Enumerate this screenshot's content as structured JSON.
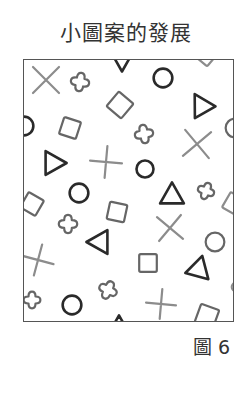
{
  "title": "小圖案的發展",
  "caption": {
    "label": "圖",
    "number": "6"
  },
  "colors": {
    "dark": "#2a2a2a",
    "mid": "#666666",
    "light": "#8c8c8c",
    "frame": "#555555"
  },
  "shapes": [
    {
      "type": "cross-x",
      "x": 22,
      "y": 20,
      "s": 13,
      "c": "light",
      "r": 0
    },
    {
      "type": "clover",
      "x": 56,
      "y": 22,
      "s": 11,
      "c": "mid",
      "r": 10
    },
    {
      "type": "triangle",
      "x": 98,
      "y": -2,
      "s": 15,
      "c": "dark",
      "r": 180
    },
    {
      "type": "circle",
      "x": 139,
      "y": 18,
      "s": 11,
      "c": "dark",
      "r": 0
    },
    {
      "type": "square",
      "x": 182,
      "y": -6,
      "s": 11,
      "c": "light",
      "r": 40
    },
    {
      "type": "square",
      "x": 96,
      "y": 45,
      "s": 12,
      "c": "mid",
      "r": 40
    },
    {
      "type": "triangle",
      "x": 177,
      "y": 45,
      "s": 14,
      "c": "dark",
      "r": -30
    },
    {
      "type": "circle",
      "x": 0,
      "y": 66,
      "s": 11,
      "c": "dark",
      "r": 0
    },
    {
      "type": "square",
      "x": 46,
      "y": 68,
      "s": 11,
      "c": "mid",
      "r": 18
    },
    {
      "type": "clover",
      "x": 120,
      "y": 74,
      "s": 11,
      "c": "mid",
      "r": -10
    },
    {
      "type": "cross-x",
      "x": 173,
      "y": 84,
      "s": 13,
      "c": "light",
      "r": 5
    },
    {
      "type": "circle",
      "x": 211,
      "y": 68,
      "s": 11,
      "c": "mid",
      "r": 0
    },
    {
      "type": "triangle",
      "x": 30,
      "y": 103,
      "s": 14,
      "c": "dark",
      "r": 90
    },
    {
      "type": "plus",
      "x": 82,
      "y": 102,
      "s": 16,
      "c": "light",
      "r": 5
    },
    {
      "type": "circle",
      "x": 121,
      "y": 109,
      "s": 10,
      "c": "dark",
      "r": 0
    },
    {
      "type": "circle",
      "x": 55,
      "y": 133,
      "s": 11,
      "c": "dark",
      "r": 0
    },
    {
      "type": "triangle",
      "x": 148,
      "y": 135,
      "s": 14,
      "c": "dark",
      "r": 0
    },
    {
      "type": "clover",
      "x": 182,
      "y": 131,
      "s": 10,
      "c": "mid",
      "r": 20
    },
    {
      "type": "square",
      "x": 8,
      "y": 144,
      "s": 11,
      "c": "mid",
      "r": 30
    },
    {
      "type": "square",
      "x": 93,
      "y": 152,
      "s": 11,
      "c": "mid",
      "r": 12
    },
    {
      "type": "square",
      "x": 210,
      "y": 144,
      "s": 11,
      "c": "light",
      "r": 30
    },
    {
      "type": "clover",
      "x": 44,
      "y": 164,
      "s": 11,
      "c": "mid",
      "r": 0
    },
    {
      "type": "cross-x",
      "x": 146,
      "y": 168,
      "s": 12,
      "c": "light",
      "r": -5
    },
    {
      "type": "triangle",
      "x": 75,
      "y": 182,
      "s": 14,
      "c": "dark",
      "r": -90
    },
    {
      "type": "circle",
      "x": 191,
      "y": 182,
      "s": 11,
      "c": "mid",
      "r": 0
    },
    {
      "type": "plus",
      "x": 14,
      "y": 200,
      "s": 16,
      "c": "light",
      "r": 15
    },
    {
      "type": "square",
      "x": 124,
      "y": 203,
      "s": 11,
      "c": "mid",
      "r": 0
    },
    {
      "type": "triangle",
      "x": 175,
      "y": 208,
      "s": 14,
      "c": "dark",
      "r": 15
    },
    {
      "type": "clover",
      "x": 84,
      "y": 230,
      "s": 11,
      "c": "mid",
      "r": 25
    },
    {
      "type": "clover",
      "x": 8,
      "y": 240,
      "s": 10,
      "c": "mid",
      "r": 0
    },
    {
      "type": "circle",
      "x": 48,
      "y": 245,
      "s": 11,
      "c": "dark",
      "r": 0
    },
    {
      "type": "plus",
      "x": 137,
      "y": 244,
      "s": 15,
      "c": "light",
      "r": 5
    },
    {
      "type": "square",
      "x": 183,
      "y": 256,
      "s": 12,
      "c": "mid",
      "r": 20
    },
    {
      "type": "triangle",
      "x": 95,
      "y": 268,
      "s": 14,
      "c": "dark",
      "r": 0
    },
    {
      "type": "circle",
      "x": 212,
      "y": 227,
      "s": 5,
      "c": "light",
      "r": 0
    }
  ]
}
